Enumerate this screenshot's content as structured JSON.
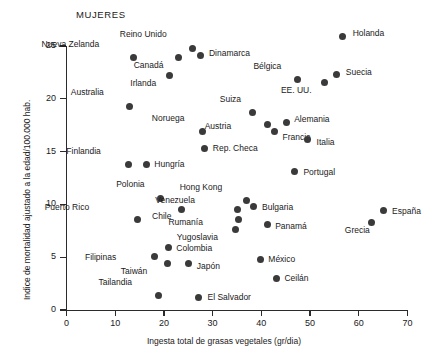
{
  "chart_data": {
    "type": "scatter",
    "title": "MUJERES",
    "xlabel": "Ingesta total de grasas vegetales (gr/dia)",
    "ylabel": "Indice de mortalidad ajustado a la edad/100.000 hab.",
    "xlim": [
      0,
      70
    ],
    "ylim": [
      0,
      26
    ],
    "xticks": [
      0,
      10,
      20,
      30,
      40,
      50,
      60,
      70
    ],
    "yticks": [
      0,
      5,
      10,
      15,
      20,
      25
    ],
    "grid": false,
    "legend": null,
    "marker_color": "#3a3a3a",
    "axis_color": "#2b2b2b",
    "points": [
      {
        "label": "Holanda",
        "x": 56.7,
        "y": 25.9,
        "lx": 10,
        "ly": -4
      },
      {
        "label": "Reino Unido",
        "x": 25.9,
        "y": 24.8,
        "lx": -26,
        "ly": -15
      },
      {
        "label": "Nueva Zelanda",
        "x": 13.7,
        "y": 23.9,
        "lx": -34,
        "ly": -15
      },
      {
        "label": "Dinamarca",
        "x": 27.6,
        "y": 24.1,
        "lx": 8,
        "ly": -4
      },
      {
        "label": "Canadá",
        "x": 23.0,
        "y": 23.9,
        "lx": -15,
        "ly": 6
      },
      {
        "label": "Suecia",
        "x": 55.5,
        "y": 22.3,
        "lx": 9,
        "ly": -4
      },
      {
        "label": "Bélgica",
        "x": 47.4,
        "y": 21.8,
        "lx": -16,
        "ly": -15
      },
      {
        "label": "Irlanda",
        "x": 21.1,
        "y": 22.2,
        "lx": -13,
        "ly": 6
      },
      {
        "label": "EE. UU.",
        "x": 53.0,
        "y": 21.5,
        "lx": -13,
        "ly": 6
      },
      {
        "label": "Australia",
        "x": 13.0,
        "y": 19.3,
        "lx": -26,
        "ly": -15
      },
      {
        "label": "Suiza",
        "x": 38.1,
        "y": 18.7,
        "lx": -11,
        "ly": -15
      },
      {
        "label": "Alemania",
        "x": 45.1,
        "y": 17.8,
        "lx": 8,
        "ly": -4
      },
      {
        "label": "Austria",
        "x": 41.2,
        "y": 17.6,
        "lx": -36,
        "ly": 1
      },
      {
        "label": "Noruega",
        "x": 27.9,
        "y": 16.9,
        "lx": -18,
        "ly": -15
      },
      {
        "label": "Francia",
        "x": 42.7,
        "y": 16.9,
        "lx": 8,
        "ly": 4
      },
      {
        "label": "Italia",
        "x": 49.5,
        "y": 16.1,
        "lx": 9,
        "ly": 1
      },
      {
        "label": "Rep. Checa",
        "x": 28.4,
        "y": 15.3,
        "lx": 8,
        "ly": -1
      },
      {
        "label": "Finlandia",
        "x": 12.8,
        "y": 13.8,
        "lx": -28,
        "ly": -14
      },
      {
        "label": "Hungría",
        "x": 16.4,
        "y": 13.8,
        "lx": 8,
        "ly": -1
      },
      {
        "label": "Portugal",
        "x": 46.8,
        "y": 13.1,
        "lx": 9,
        "ly": -1
      },
      {
        "label": "Polonia",
        "x": 19.3,
        "y": 10.6,
        "lx": -16,
        "ly": -15
      },
      {
        "label": "Hong Kong",
        "x": 36.9,
        "y": 10.4,
        "lx": -24,
        "ly": -14
      },
      {
        "label": "Venezuela",
        "x": 35.2,
        "y": 9.5,
        "lx": -43,
        "ly": -11
      },
      {
        "label": "Chile",
        "x": 23.6,
        "y": 9.5,
        "lx": -10,
        "ly": 5
      },
      {
        "label": "Bulgaria",
        "x": 38.5,
        "y": 9.8,
        "lx": 8,
        "ly": -1
      },
      {
        "label": "Rumanía",
        "x": 35.4,
        "y": 8.6,
        "lx": -36,
        "ly": 2
      },
      {
        "label": "Panamá",
        "x": 41.2,
        "y": 8.1,
        "lx": 8,
        "ly": 1
      },
      {
        "label": "Puerto Rico",
        "x": 14.5,
        "y": 8.6,
        "lx": -48,
        "ly": -13
      },
      {
        "label": "Yugoslavia",
        "x": 34.8,
        "y": 7.6,
        "lx": -18,
        "ly": 6
      },
      {
        "label": "Colombia",
        "x": 20.9,
        "y": 5.9,
        "lx": 8,
        "ly": -1
      },
      {
        "label": "Filipinas",
        "x": 18.0,
        "y": 5.1,
        "lx": -38,
        "ly": 0
      },
      {
        "label": "Taiwán",
        "x": 20.7,
        "y": 4.4,
        "lx": -20,
        "ly": 6
      },
      {
        "label": "Japón",
        "x": 25.1,
        "y": 4.4,
        "lx": 8,
        "ly": 1
      },
      {
        "label": "México",
        "x": 39.8,
        "y": 4.8,
        "lx": 8,
        "ly": -1
      },
      {
        "label": "Ceilán",
        "x": 43.1,
        "y": 3.0,
        "lx": 8,
        "ly": -1
      },
      {
        "label": "España",
        "x": 65.0,
        "y": 9.4,
        "lx": 9,
        "ly": -1
      },
      {
        "label": "Grecia",
        "x": 62.7,
        "y": 8.3,
        "lx": -2,
        "ly": 7
      },
      {
        "label": "Tailandia",
        "x": 18.8,
        "y": 1.4,
        "lx": -26,
        "ly": -14
      },
      {
        "label": "El Salvador",
        "x": 27.1,
        "y": 1.2,
        "lx": 9,
        "ly": -1
      }
    ]
  }
}
